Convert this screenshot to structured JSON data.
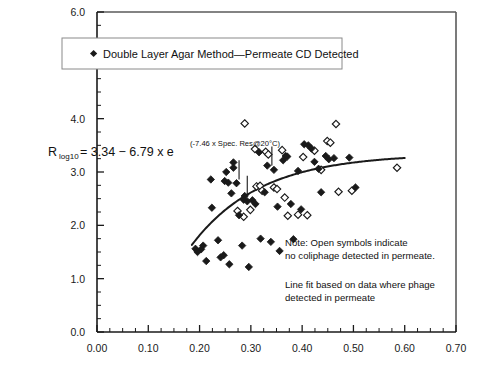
{
  "chart_data": {
    "type": "scatter",
    "title": "",
    "xlabel": "",
    "ylabel": "",
    "xlim": [
      0.0,
      0.7
    ],
    "ylim": [
      0.0,
      6.0
    ],
    "xticks": [
      "0.00",
      "0.10",
      "0.20",
      "0.30",
      "0.40",
      "0.50",
      "0.60",
      "0.70"
    ],
    "xtick_values": [
      0.0,
      0.1,
      0.2,
      0.3,
      0.4,
      0.5,
      0.6,
      0.7
    ],
    "yticks": [
      "0.0",
      "1.0",
      "2.0",
      "3.0",
      "4.0",
      "5.0",
      "6.0"
    ],
    "ytick_values": [
      0.0,
      1.0,
      2.0,
      3.0,
      4.0,
      5.0,
      6.0
    ],
    "x_minor_step": 0.025,
    "y_minor_step": 0.25,
    "grid": false,
    "legend_position": "top-center",
    "legend": [
      {
        "label": "Double Layer Agar Method—Permeate CD Detected",
        "marker": "filled-diamond",
        "color": "#1a1a1a"
      }
    ],
    "annotations": [
      {
        "name": "fit-equation",
        "text": "Rlog10 = 3.34 − 6.79 x e(-7.46 x Spec. Res@20°C)",
        "parts": {
          "r": "R",
          "r_sub": "log10",
          "body": " = 3.34 − 6.79 x e",
          "exponent": "(-7.46 x Spec. Res@20°C)"
        }
      },
      {
        "name": "note-open-symbols",
        "lines": [
          "Note: Open symbols indicate",
          "no coliphage detected in permeate."
        ]
      },
      {
        "name": "note-line-fit",
        "lines": [
          "Line fit based on data where phage",
          "detected in permeate"
        ]
      }
    ],
    "fit_curve": {
      "name": "exponential-fit-line",
      "equation": "R = 3.34 - 6.79 * exp(-7.46 * x)",
      "a": 3.34,
      "b": 6.79,
      "k": 7.46,
      "x_start": 0.185,
      "x_end": 0.6,
      "color": "#1a1a1a",
      "width": 2.0
    },
    "series": [
      {
        "name": "Permeate CD Detected",
        "marker": "filled-diamond",
        "color": "#1a1a1a",
        "points": [
          [
            0.192,
            1.56
          ],
          [
            0.196,
            1.5
          ],
          [
            0.203,
            1.55
          ],
          [
            0.207,
            1.62
          ],
          [
            0.213,
            1.33
          ],
          [
            0.224,
            2.33
          ],
          [
            0.222,
            2.86
          ],
          [
            0.236,
            1.72
          ],
          [
            0.241,
            1.4
          ],
          [
            0.247,
            1.44
          ],
          [
            0.252,
            3.0
          ],
          [
            0.249,
            2.83
          ],
          [
            0.256,
            2.8
          ],
          [
            0.258,
            1.27
          ],
          [
            0.262,
            2.6
          ],
          [
            0.266,
            3.08
          ],
          [
            0.266,
            3.18
          ],
          [
            0.272,
            2.79
          ],
          [
            0.277,
            2.19
          ],
          [
            0.283,
            1.62
          ],
          [
            0.288,
            2.55
          ],
          [
            0.286,
            2.48
          ],
          [
            0.293,
            2.45
          ],
          [
            0.296,
            1.22
          ],
          [
            0.303,
            2.47
          ],
          [
            0.309,
            2.4
          ],
          [
            0.316,
            3.37
          ],
          [
            0.319,
            1.75
          ],
          [
            0.327,
            2.62
          ],
          [
            0.332,
            3.12
          ],
          [
            0.339,
            1.69
          ],
          [
            0.345,
            3.04
          ],
          [
            0.352,
            2.35
          ],
          [
            0.356,
            1.52
          ],
          [
            0.363,
            3.22
          ],
          [
            0.368,
            3.3
          ],
          [
            0.371,
            3.29
          ],
          [
            0.378,
            2.4
          ],
          [
            0.383,
            1.74
          ],
          [
            0.392,
            3.02
          ],
          [
            0.398,
            2.3
          ],
          [
            0.404,
            3.52
          ],
          [
            0.412,
            3.5
          ],
          [
            0.418,
            3.44
          ],
          [
            0.424,
            3.19
          ],
          [
            0.432,
            3.06
          ],
          [
            0.437,
            2.62
          ],
          [
            0.446,
            3.3
          ],
          [
            0.452,
            3.24
          ],
          [
            0.462,
            3.26
          ],
          [
            0.492,
            3.27
          ],
          [
            0.504,
            2.71
          ]
        ]
      },
      {
        "name": "No coliphage detected in permeate",
        "marker": "open-diamond",
        "color": "#1a1a1a",
        "points": [
          [
            0.288,
            3.91
          ],
          [
            0.274,
            2.27
          ],
          [
            0.286,
            2.16
          ],
          [
            0.299,
            2.29
          ],
          [
            0.308,
            3.43
          ],
          [
            0.311,
            2.73
          ],
          [
            0.318,
            2.74
          ],
          [
            0.322,
            2.65
          ],
          [
            0.329,
            3.38
          ],
          [
            0.334,
            3.33
          ],
          [
            0.345,
            2.71
          ],
          [
            0.351,
            2.68
          ],
          [
            0.361,
            3.41
          ],
          [
            0.366,
            2.52
          ],
          [
            0.372,
            2.18
          ],
          [
            0.392,
            2.2
          ],
          [
            0.402,
            3.28
          ],
          [
            0.41,
            2.19
          ],
          [
            0.424,
            3.4
          ],
          [
            0.437,
            3.04
          ],
          [
            0.449,
            3.58
          ],
          [
            0.455,
            3.55
          ],
          [
            0.466,
            3.9
          ],
          [
            0.471,
            2.63
          ],
          [
            0.497,
            2.65
          ],
          [
            0.585,
            3.08
          ]
        ]
      }
    ],
    "error_bars": [
      {
        "x": 0.293,
        "y_low": 2.57,
        "y_high": 2.93
      },
      {
        "x": 0.341,
        "y_low": 3.12,
        "y_high": 3.48
      },
      {
        "x": 0.277,
        "y_low": 2.86,
        "y_high": 3.22
      }
    ]
  }
}
